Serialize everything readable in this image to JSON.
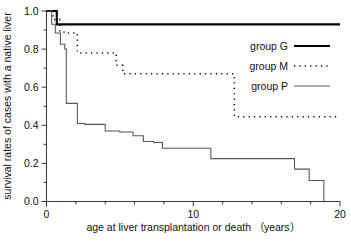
{
  "chart_data": {
    "type": "line",
    "title": "",
    "xlabel": "age at liver transplantation or death （years）",
    "ylabel": "survival rates of cases with a native liver",
    "xlim": [
      0,
      20
    ],
    "ylim": [
      0,
      1.0
    ],
    "grid": false,
    "legend_position": "upper right",
    "x_ticks_major": [
      0,
      10,
      20
    ],
    "x_tick_labels": [
      "0",
      "10",
      "20"
    ],
    "x_ticks_minor": [
      2,
      4,
      6,
      8,
      12,
      14,
      16,
      18
    ],
    "y_ticks_major": [
      0.0,
      0.2,
      0.4,
      0.6,
      0.8,
      1.0
    ],
    "y_tick_labels": [
      "0.0",
      "0.2",
      "0.4",
      "0.6",
      "0.8",
      "1.0"
    ],
    "y_ticks_minor": [
      0.1,
      0.3,
      0.5,
      0.7,
      0.9
    ],
    "step_type": "post",
    "series": [
      {
        "name": "group G",
        "style": "solid-thick",
        "color": "#000000",
        "x": [
          0,
          0.7,
          0.7,
          20
        ],
        "y": [
          1.0,
          1.0,
          0.93,
          0.93
        ]
      },
      {
        "name": "group M",
        "style": "dotted",
        "color": "#000000",
        "x": [
          0,
          0.45,
          0.45,
          0.9,
          0.9,
          1.45,
          1.45,
          2.1,
          2.1,
          4.75,
          4.75,
          5.2,
          5.2,
          12.8,
          12.8,
          20
        ],
        "y": [
          1.0,
          1.0,
          0.955,
          0.955,
          0.89,
          0.89,
          0.885,
          0.885,
          0.78,
          0.78,
          0.715,
          0.715,
          0.67,
          0.67,
          0.445,
          0.445
        ]
      },
      {
        "name": "group P",
        "style": "solid-thin",
        "color": "#555555",
        "x": [
          0,
          0.35,
          0.35,
          0.6,
          0.6,
          0.95,
          0.95,
          1.25,
          1.25,
          1.35,
          1.35,
          2.1,
          2.1,
          2.6,
          2.6,
          4.0,
          4.0,
          5.0,
          5.0,
          5.9,
          5.9,
          6.6,
          6.6,
          7.3,
          7.3,
          7.9,
          7.9,
          11.2,
          11.2,
          16.9,
          16.9,
          17.9,
          17.9,
          18.9,
          18.9
        ],
        "y": [
          1.0,
          1.0,
          0.93,
          0.93,
          0.885,
          0.885,
          0.825,
          0.825,
          0.8,
          0.8,
          0.515,
          0.515,
          0.41,
          0.41,
          0.405,
          0.405,
          0.37,
          0.37,
          0.365,
          0.365,
          0.345,
          0.345,
          0.315,
          0.315,
          0.31,
          0.31,
          0.28,
          0.28,
          0.225,
          0.225,
          0.17,
          0.17,
          0.11,
          0.11,
          0.0
        ]
      }
    ]
  },
  "legend": {
    "entries": [
      {
        "label": "group G",
        "style": "solid-thick"
      },
      {
        "label": "group M",
        "style": "dotted"
      },
      {
        "label": "group P",
        "style": "solid-thin"
      }
    ]
  },
  "axes": {
    "y_title": "survival rates of cases with a native liver",
    "x_title": "age at liver transplantation or death （years）",
    "y_labels": [
      "1.0",
      "0.8",
      "0.6",
      "0.4",
      "0.2",
      "0.0"
    ],
    "x_labels": [
      "0",
      "10",
      "20"
    ]
  }
}
